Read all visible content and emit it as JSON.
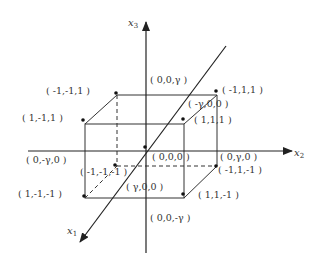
{
  "axes": {
    "x1": {
      "label": "x",
      "sub": "1"
    },
    "x2": {
      "label": "x",
      "sub": "2"
    },
    "x3": {
      "label": "x",
      "sub": "3"
    }
  },
  "labels": {
    "v_m1m11": "( -1,-1,1 )",
    "v_1m11": "( 1,-1,1 )",
    "v_m111": "( -1,1,1 )",
    "v_111": "( 1,1,1 )",
    "v_1m1m1": "( 1,-1,-1 )",
    "v_m1m1m1": "( -1,-1,-1 )",
    "v_m11m1": "( -1,1,-1 )",
    "v_11m1": "( 1,1,-1 )",
    "p_00g": "( 0,0,γ )",
    "p_00mg": "( 0,0,-γ )",
    "p_mg00": "( -γ,0,0 )",
    "p_g00": "( γ,0,0 )",
    "p_0g0": "( 0,γ,0 )",
    "p_0mg0": "( 0,-γ,0 )",
    "origin": "( 0,0,0 )"
  },
  "colors": {
    "line": "#333333",
    "background": "#ffffff"
  }
}
